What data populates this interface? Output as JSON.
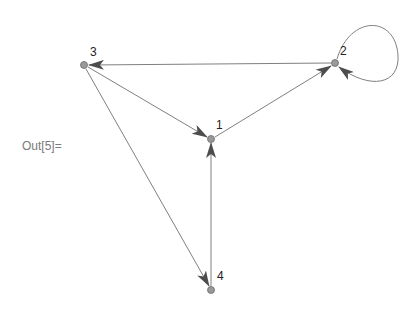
{
  "cell": {
    "out_label": "Out[5]="
  },
  "graph": {
    "colors": {
      "edge": "#808080",
      "arrow": "#4d4d4d",
      "node_fill": "#999999",
      "node_stroke": "#6b6b6b",
      "label": "#222222"
    },
    "nodes": [
      {
        "id": "1",
        "label": "1",
        "x": 211,
        "y": 139
      },
      {
        "id": "2",
        "label": "2",
        "x": 335,
        "y": 63
      },
      {
        "id": "3",
        "label": "3",
        "x": 84,
        "y": 65
      },
      {
        "id": "4",
        "label": "4",
        "x": 211,
        "y": 290
      }
    ],
    "edges": [
      {
        "from": "2",
        "to": "3"
      },
      {
        "from": "3",
        "to": "1"
      },
      {
        "from": "1",
        "to": "2"
      },
      {
        "from": "2",
        "to": "2"
      },
      {
        "from": "3",
        "to": "4"
      },
      {
        "from": "4",
        "to": "1"
      }
    ]
  }
}
